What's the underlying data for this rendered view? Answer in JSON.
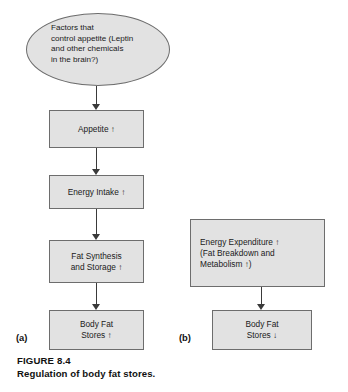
{
  "figure": {
    "number_label": "FIGURE 8.4",
    "caption": "Regulation of body fat stores.",
    "colors": {
      "node_fill": "#e2e2e2",
      "node_border": "#6d6d6d",
      "arrow": "#3a3a3a",
      "text": "#1a1a1a",
      "background": "#ffffff"
    }
  },
  "panel_a": {
    "letter": "(a)",
    "nodes": {
      "start_ellipse": "Factors that\ncontrol appetite (Leptin\nand other chemicals\nin the brain?)",
      "appetite": "Appetite ↑",
      "energy_intake": "Energy Intake ↑",
      "fat_synthesis": "Fat Synthesis\nand Storage ↑",
      "body_fat_stores": "Body Fat\nStores ↑"
    }
  },
  "panel_b": {
    "letter": "(b)",
    "nodes": {
      "energy_expenditure": "Energy Expenditure ↑\n(Fat Breakdown and\nMetabolism ↑)",
      "body_fat_stores": "Body Fat\nStores ↓"
    }
  }
}
